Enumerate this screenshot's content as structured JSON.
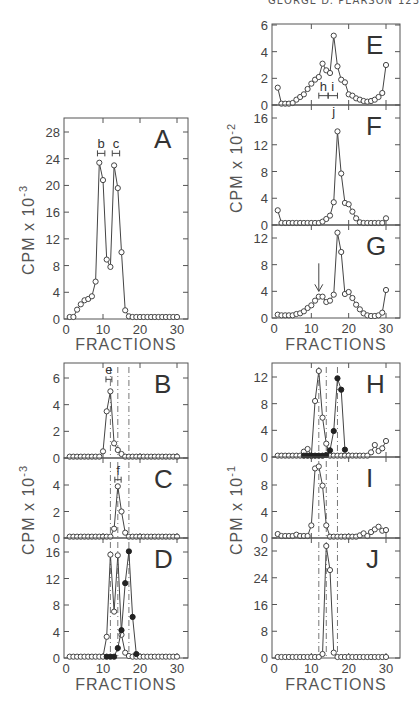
{
  "header": {
    "running_head": "GEORGE D. PEARSON",
    "page": "123"
  },
  "chart_data": [
    {
      "panel": "A",
      "type": "line",
      "xlabel": "FRACTIONS",
      "ylabel": "CPM x 10^-3",
      "ylim": [
        0,
        30
      ],
      "yticks": [
        0,
        4,
        8,
        12,
        16,
        20,
        24,
        28
      ],
      "xlim": [
        0,
        33
      ],
      "xticks": [
        0,
        10,
        20,
        30
      ],
      "box": {
        "x0": 64,
        "x1": 188,
        "y_top": 118,
        "y_zero": 319,
        "y_ref_val": 28,
        "y_ref_px": 132,
        "x_ref_val": 30,
        "x_ref_px": 177
      },
      "series": [
        {
          "name": "open",
          "marker": "open",
          "x": [
            1,
            2,
            3,
            4,
            5,
            6,
            7,
            8,
            9,
            10,
            11,
            12,
            13,
            14,
            15,
            16,
            17,
            18,
            19,
            20,
            21,
            22,
            23,
            24,
            25,
            26,
            27,
            28,
            29,
            30
          ],
          "y": [
            0.3,
            0.3,
            1.4,
            2.2,
            2.8,
            3.0,
            3.4,
            5.6,
            23.4,
            20.8,
            8.9,
            7.8,
            23.0,
            19.6,
            10.0,
            1.3,
            0.4,
            0.3,
            0.3,
            0.3,
            0.3,
            0.3,
            0.3,
            0.3,
            0.3,
            0.3,
            0.3,
            0.3,
            0.3,
            0.3
          ]
        }
      ],
      "annotations": [
        {
          "label": "b",
          "x0": 8.5,
          "x1": 10.5,
          "y": 24.8
        },
        {
          "label": "c",
          "x0": 12.5,
          "x1": 14.5,
          "y": 24.8
        }
      ],
      "show_xlabels": true
    },
    {
      "panel": "E",
      "type": "line",
      "ylabel": "CPM x 10^-2",
      "ylim": [
        0,
        6
      ],
      "yticks": [
        0,
        2,
        4,
        6
      ],
      "xlim": [
        0,
        33
      ],
      "xticks": [
        0,
        10,
        20,
        30
      ],
      "box": {
        "x0": 272,
        "x1": 400,
        "y_top": 24,
        "y_zero": 105,
        "y_ref_val": 6,
        "y_ref_px": 25,
        "x_ref_val": 30,
        "x_ref_px": 386
      },
      "series": [
        {
          "name": "open",
          "marker": "open",
          "x": [
            1,
            2,
            3,
            4,
            5,
            6,
            7,
            8,
            9,
            10,
            11,
            12,
            13,
            14,
            15,
            16,
            17,
            18,
            19,
            20,
            21,
            22,
            23,
            24,
            25,
            26,
            27,
            28,
            29,
            30
          ],
          "y": [
            1.3,
            0.1,
            0.1,
            0.1,
            0.15,
            0.4,
            0.6,
            0.8,
            1.2,
            1.6,
            1.9,
            2.1,
            3.1,
            2.6,
            2.4,
            5.2,
            2.9,
            1.9,
            1.7,
            0.8,
            0.7,
            0.5,
            0.4,
            0.3,
            0.25,
            0.3,
            0.4,
            0.6,
            0.9,
            3.0
          ]
        }
      ],
      "annotations": [
        {
          "label": "h",
          "x0": 12,
          "x1": 14.5,
          "y": 0.7
        },
        {
          "label": "i",
          "x0": 14.5,
          "x1": 17,
          "y": 0.7
        }
      ],
      "show_xlabels": false
    },
    {
      "panel": "F",
      "type": "line",
      "ylabel": "CPM x 10^-2",
      "ylim": [
        0,
        17.5
      ],
      "yticks": [
        0,
        4,
        8,
        12,
        16
      ],
      "box": {
        "x0": 272,
        "x1": 400,
        "y_top": 105,
        "y_zero": 225,
        "y_ref_val": 16,
        "y_ref_px": 118,
        "x_ref_val": 30,
        "x_ref_px": 386
      },
      "series": [
        {
          "name": "open",
          "marker": "open",
          "x": [
            1,
            2,
            3,
            4,
            5,
            6,
            7,
            8,
            9,
            10,
            11,
            12,
            13,
            14,
            15,
            16,
            17,
            18,
            19,
            20,
            21,
            22,
            23,
            24,
            25,
            26,
            27,
            28,
            29,
            30
          ],
          "y": [
            2.2,
            0.3,
            0.3,
            0.3,
            0.3,
            0.3,
            0.3,
            0.3,
            0.3,
            0.3,
            0.3,
            0.3,
            0.5,
            0.9,
            1.4,
            3.4,
            14.0,
            7.7,
            3.3,
            3.1,
            2.0,
            1.0,
            0.4,
            0.3,
            0.3,
            0.3,
            0.3,
            0.3,
            0.3,
            1.0
          ]
        }
      ],
      "annotations": [
        {
          "label": "j",
          "x0": 16,
          "x1": 16,
          "y": 15.5
        }
      ],
      "show_xlabels": false
    },
    {
      "panel": "G",
      "type": "line",
      "xlabel": "FRACTIONS",
      "ylim": [
        0,
        13.5
      ],
      "yticks": [
        0,
        4,
        8,
        12
      ],
      "box": {
        "x0": 272,
        "x1": 400,
        "y_top": 225,
        "y_zero": 318,
        "y_ref_val": 12,
        "y_ref_px": 238,
        "x_ref_val": 30,
        "x_ref_px": 386
      },
      "series": [
        {
          "name": "open",
          "marker": "open",
          "x": [
            1,
            2,
            3,
            4,
            5,
            6,
            7,
            8,
            9,
            10,
            11,
            12,
            13,
            14,
            15,
            16,
            17,
            18,
            19,
            20,
            21,
            22,
            23,
            24,
            25,
            26,
            27,
            28,
            29,
            30
          ],
          "y": [
            0.5,
            0.4,
            0.4,
            0.4,
            0.4,
            0.6,
            0.7,
            1.0,
            1.5,
            1.9,
            2.6,
            3.2,
            3.2,
            2.4,
            2.6,
            3.5,
            12.8,
            9.9,
            3.6,
            3.9,
            3.0,
            2.0,
            1.3,
            0.7,
            0.4,
            0.3,
            0.3,
            0.4,
            0.8,
            4.2
          ]
        }
      ],
      "arrow": {
        "x": 12,
        "y_from": 8.2,
        "y_to": 4.0
      },
      "show_xlabels": true
    },
    {
      "panel": "B",
      "type": "line",
      "ylabel": "CPM x 10^-3",
      "ylim": [
        0,
        7
      ],
      "yticks": [
        0,
        2,
        4,
        6
      ],
      "box": {
        "x0": 64,
        "x1": 188,
        "y_top": 363,
        "y_zero": 458,
        "y_ref_val": 6,
        "y_ref_px": 378,
        "x_ref_val": 30,
        "x_ref_px": 177
      },
      "series": [
        {
          "name": "open",
          "marker": "open",
          "x": [
            1,
            2,
            3,
            4,
            5,
            6,
            7,
            8,
            9,
            10,
            11,
            12,
            13,
            14,
            15,
            16,
            17,
            18,
            19,
            20,
            21,
            22,
            23,
            24,
            25,
            26,
            27,
            28,
            29,
            30
          ],
          "y": [
            0.1,
            0.1,
            0.1,
            0.1,
            0.1,
            0.1,
            0.1,
            0.1,
            0.1,
            0.5,
            3.5,
            5.0,
            1.1,
            0.6,
            0.3,
            0.1,
            0.1,
            0.1,
            0.1,
            0.1,
            0.1,
            0.1,
            0.1,
            0.1,
            0.1,
            0.1,
            0.1,
            0.1,
            0.1,
            0.1
          ]
        }
      ],
      "annotations": [
        {
          "label": "e",
          "x0": 10.8,
          "x1": 12.4,
          "y": 5.9
        }
      ],
      "dashed_lines": [
        12,
        14,
        17
      ],
      "show_xlabels": false
    },
    {
      "panel": "C",
      "type": "line",
      "ylim": [
        0,
        5.2
      ],
      "yticks": [
        0,
        2,
        4
      ],
      "box": {
        "x0": 64,
        "x1": 188,
        "y_top": 458,
        "y_zero": 538,
        "y_ref_val": 4,
        "y_ref_px": 485,
        "x_ref_val": 30,
        "x_ref_px": 177
      },
      "series": [
        {
          "name": "open",
          "marker": "open",
          "x": [
            1,
            2,
            3,
            4,
            5,
            6,
            7,
            8,
            9,
            10,
            11,
            12,
            13,
            14,
            15,
            16,
            17,
            18,
            19,
            20,
            21,
            22,
            23,
            24,
            25,
            26,
            27,
            28,
            29,
            30
          ],
          "y": [
            0.1,
            0.1,
            0.1,
            0.1,
            0.1,
            0.1,
            0.1,
            0.1,
            0.1,
            0.1,
            0.1,
            0.1,
            0.7,
            3.9,
            2.0,
            0.4,
            0.1,
            0.1,
            0.1,
            0.1,
            0.1,
            0.1,
            0.1,
            0.1,
            0.1,
            0.1,
            0.1,
            0.1,
            0.1,
            0.1
          ]
        }
      ],
      "annotations": [
        {
          "label": "f",
          "x0": 13.2,
          "x1": 14.9,
          "y": 4.4
        }
      ],
      "dashed_lines": [
        12,
        14,
        17
      ],
      "show_xlabels": false
    },
    {
      "panel": "D",
      "type": "line",
      "xlabel": "FRACTIONS",
      "ylim": [
        0,
        17.5
      ],
      "yticks": [
        0,
        4,
        8,
        12,
        16
      ],
      "box": {
        "x0": 64,
        "x1": 188,
        "y_top": 538,
        "y_zero": 658,
        "y_ref_val": 16,
        "y_ref_px": 552,
        "x_ref_val": 30,
        "x_ref_px": 177
      },
      "series": [
        {
          "name": "open",
          "marker": "open",
          "x": [
            1,
            2,
            3,
            4,
            5,
            6,
            7,
            8,
            9,
            10,
            11,
            12,
            13,
            14,
            15,
            16,
            17,
            18,
            19,
            20,
            21,
            22,
            23,
            24,
            25,
            26,
            27,
            28,
            29,
            30
          ],
          "y": [
            0.2,
            0.2,
            0.2,
            0.2,
            0.2,
            0.2,
            0.2,
            0.2,
            0.2,
            0.2,
            3.2,
            15.6,
            7.0,
            15.5,
            3.5,
            0.8,
            0.3,
            0.2,
            0.2,
            0.2,
            0.2,
            0.2,
            0.2,
            0.2,
            0.2,
            0.2,
            0.2,
            0.2,
            0.2,
            0.2
          ]
        },
        {
          "name": "filled",
          "marker": "filled",
          "x": [
            11,
            12,
            13,
            14,
            15,
            16,
            17,
            18,
            19
          ],
          "y": [
            0.2,
            0.2,
            0.2,
            1.5,
            4.2,
            11.3,
            16.1,
            6.2,
            0.6
          ]
        }
      ],
      "dashed_lines": [
        12,
        14,
        17
      ],
      "show_xlabels": true
    },
    {
      "panel": "H",
      "type": "line",
      "ylabel": "CPM x 10^-1",
      "ylim": [
        0,
        14
      ],
      "yticks": [
        0,
        4,
        8,
        12
      ],
      "box": {
        "x0": 272,
        "x1": 400,
        "y_top": 363,
        "y_zero": 457,
        "y_ref_val": 12,
        "y_ref_px": 377,
        "x_ref_val": 30,
        "x_ref_px": 386
      },
      "series": [
        {
          "name": "open",
          "marker": "open",
          "x": [
            1,
            2,
            3,
            4,
            5,
            6,
            7,
            8,
            9,
            10,
            11,
            12,
            13,
            14,
            15,
            16,
            17,
            18,
            19,
            20,
            21,
            22,
            23,
            24,
            25,
            26,
            27,
            28,
            29,
            30
          ],
          "y": [
            0.2,
            0.2,
            0.2,
            0.2,
            0.2,
            0.2,
            0.2,
            0.8,
            1.2,
            0.2,
            8.4,
            12.9,
            5.9,
            2.0,
            0.2,
            0.2,
            0.2,
            0.2,
            0.2,
            0.2,
            0.2,
            0.2,
            0.2,
            0.2,
            0.2,
            0.7,
            1.8,
            0.9,
            1.3,
            2.4
          ]
        },
        {
          "name": "filled",
          "marker": "filled",
          "x": [
            8,
            9,
            10,
            11,
            12,
            13,
            14,
            15,
            16,
            17,
            18,
            19
          ],
          "y": [
            0.2,
            0.2,
            0.2,
            0.2,
            0.2,
            0.2,
            0.3,
            1.0,
            3.9,
            11.8,
            10.1,
            1.1
          ]
        }
      ],
      "dashed_lines": [
        12,
        14,
        17
      ],
      "show_xlabels": false
    },
    {
      "panel": "I",
      "type": "line",
      "ylim": [
        0,
        11
      ],
      "yticks": [
        0,
        4,
        8
      ],
      "box": {
        "x0": 272,
        "x1": 400,
        "y_top": 457,
        "y_zero": 538,
        "y_ref_val": 8,
        "y_ref_px": 485,
        "x_ref_val": 30,
        "x_ref_px": 386
      },
      "series": [
        {
          "name": "open",
          "marker": "open",
          "x": [
            1,
            2,
            3,
            4,
            5,
            6,
            7,
            8,
            9,
            10,
            11,
            12,
            13,
            14,
            15,
            16,
            17,
            18,
            19,
            20,
            21,
            22,
            23,
            24,
            25,
            26,
            27,
            28,
            29,
            30
          ],
          "y": [
            0.6,
            0.3,
            0.3,
            0.3,
            0.3,
            0.5,
            0.3,
            0.3,
            0.3,
            1.9,
            10.5,
            10.8,
            7.9,
            1.9,
            0.2,
            0.2,
            0.2,
            0.2,
            0.2,
            0.2,
            0.2,
            0.2,
            0.4,
            0.7,
            0.3,
            0.9,
            1.3,
            1.7,
            1.1,
            1.2
          ]
        }
      ],
      "dashed_lines": [
        12,
        14,
        17
      ],
      "show_xlabels": false
    },
    {
      "panel": "J",
      "type": "line",
      "xlabel": "FRACTIONS",
      "ylim": [
        0,
        35
      ],
      "yticks": [
        0,
        8,
        16,
        24,
        32
      ],
      "box": {
        "x0": 272,
        "x1": 400,
        "y_top": 538,
        "y_zero": 658,
        "y_ref_val": 32,
        "y_ref_px": 551,
        "x_ref_val": 30,
        "x_ref_px": 386
      },
      "series": [
        {
          "name": "open",
          "marker": "open",
          "x": [
            1,
            2,
            3,
            4,
            5,
            6,
            7,
            8,
            9,
            10,
            11,
            12,
            13,
            14,
            15,
            16,
            17,
            18,
            19,
            20,
            21,
            22,
            23,
            24,
            25,
            26,
            27,
            28,
            29,
            30
          ],
          "y": [
            0.3,
            0.3,
            0.3,
            0.3,
            0.3,
            0.3,
            0.3,
            0.3,
            0.3,
            0.3,
            0.3,
            0.3,
            1.2,
            33.5,
            26.3,
            1.6,
            0.3,
            0.3,
            0.3,
            0.3,
            0.3,
            0.3,
            0.3,
            0.3,
            0.3,
            0.3,
            0.3,
            0.3,
            0.3,
            0.3
          ]
        }
      ],
      "dashed_lines": [
        12,
        14,
        17
      ],
      "show_xlabels": true
    }
  ],
  "axis_labels": {
    "left_top": "CPM x 10",
    "left_top_exp": "-3",
    "right_top": "CPM x 10",
    "right_top_exp": "-2",
    "left_bottom": "CPM x 10",
    "left_bottom_exp": "-3",
    "right_bottom": "CPM x 10",
    "right_bottom_exp": "-1",
    "fractions": "FRACTIONS"
  }
}
